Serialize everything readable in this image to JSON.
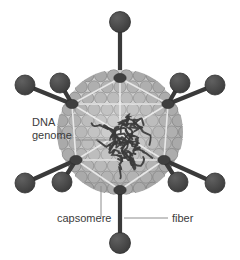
{
  "figure": {
    "background_color": "#ffffff",
    "view": "icosahedral capsid with projecting fibers"
  },
  "labels": [
    {
      "id": "dna-genome",
      "line1": "DNA",
      "line2": "genome",
      "text_x": 32,
      "text_y": 126,
      "align": "start",
      "leader": {
        "x1": 76,
        "y1": 140,
        "x2": 112,
        "y2": 140
      }
    },
    {
      "id": "capsomere",
      "line1": "capsomere",
      "line2": "",
      "text_x": 57,
      "text_y": 222,
      "align": "start",
      "leader": {
        "x1": 101,
        "y1": 217,
        "x2": 101,
        "y2": 186
      }
    },
    {
      "id": "fiber",
      "line1": "fiber",
      "line2": "",
      "text_x": 172,
      "text_y": 222,
      "align": "start",
      "leader": {
        "x1": 168,
        "y1": 218,
        "x2": 124,
        "y2": 218
      }
    }
  ],
  "colors": {
    "capsomere_fill": "#c9c9c9",
    "capsomere_stroke": "#a6a6a6",
    "fiber_shaft": "#3a3a3a",
    "fiber_knob": "#4d4d4d",
    "penton_base": "#3f3f3f",
    "dna_strand": "#3a3a3a",
    "icosahedral_edge": "#efefef",
    "label_text": "#3b3b3b",
    "leader_line": "#8c8c8c"
  },
  "capsid": {
    "center_x": 120,
    "center_y": 132,
    "radius": 62,
    "capsomere_count_visible": 252,
    "capsomere_cell_radius": 6.4
  },
  "fibers": [
    {
      "id": "fiber-top",
      "base_x": 120,
      "base_y": 78,
      "knob_x": 120,
      "knob_y": 22,
      "knob_r": 10.5
    },
    {
      "id": "fiber-bottom",
      "base_x": 120,
      "base_y": 190,
      "knob_x": 120,
      "knob_y": 243,
      "knob_r": 10.5
    },
    {
      "id": "fiber-upper-left-outer",
      "base_x": 72,
      "base_y": 104,
      "knob_x": 25,
      "knob_y": 85,
      "knob_r": 10.0
    },
    {
      "id": "fiber-upper-left-inner",
      "base_x": 72,
      "base_y": 104,
      "knob_x": 60,
      "knob_y": 83,
      "knob_r": 10.0
    },
    {
      "id": "fiber-upper-right-outer",
      "base_x": 168,
      "base_y": 104,
      "knob_x": 215,
      "knob_y": 85,
      "knob_r": 10.0
    },
    {
      "id": "fiber-upper-right-inner",
      "base_x": 168,
      "base_y": 104,
      "knob_x": 180,
      "knob_y": 83,
      "knob_r": 10.0
    },
    {
      "id": "fiber-lower-left-outer",
      "base_x": 76,
      "base_y": 160,
      "knob_x": 25,
      "knob_y": 183,
      "knob_r": 10.0
    },
    {
      "id": "fiber-lower-left-inner",
      "base_x": 76,
      "base_y": 160,
      "knob_x": 62,
      "knob_y": 182,
      "knob_r": 10.0
    },
    {
      "id": "fiber-lower-right-outer",
      "base_x": 164,
      "base_y": 160,
      "knob_x": 215,
      "knob_y": 183,
      "knob_r": 10.0
    },
    {
      "id": "fiber-lower-right-inner",
      "base_x": 164,
      "base_y": 160,
      "knob_x": 178,
      "knob_y": 182,
      "knob_r": 10.0
    }
  ],
  "penton_vertices": [
    {
      "id": "penton-top",
      "x": 120,
      "y": 78
    },
    {
      "id": "penton-bottom",
      "x": 120,
      "y": 190
    },
    {
      "id": "penton-upper-left",
      "x": 72,
      "y": 104
    },
    {
      "id": "penton-upper-right",
      "x": 168,
      "y": 104
    },
    {
      "id": "penton-lower-left",
      "x": 76,
      "y": 160
    },
    {
      "id": "penton-lower-right",
      "x": 164,
      "y": 160
    }
  ],
  "icosahedral_edges": [
    {
      "x1": 120,
      "y1": 78,
      "x2": 72,
      "y2": 104
    },
    {
      "x1": 120,
      "y1": 78,
      "x2": 168,
      "y2": 104
    },
    {
      "x1": 72,
      "y1": 104,
      "x2": 76,
      "y2": 160
    },
    {
      "x1": 168,
      "y1": 104,
      "x2": 164,
      "y2": 160
    },
    {
      "x1": 76,
      "y1": 160,
      "x2": 120,
      "y2": 190
    },
    {
      "x1": 164,
      "y1": 160,
      "x2": 120,
      "y2": 190
    },
    {
      "x1": 120,
      "y1": 78,
      "x2": 120,
      "y2": 132
    },
    {
      "x1": 72,
      "y1": 104,
      "x2": 164,
      "y2": 160
    },
    {
      "x1": 168,
      "y1": 104,
      "x2": 76,
      "y2": 160
    },
    {
      "x1": 72,
      "y1": 104,
      "x2": 168,
      "y2": 104
    },
    {
      "x1": 76,
      "y1": 160,
      "x2": 164,
      "y2": 160
    }
  ]
}
